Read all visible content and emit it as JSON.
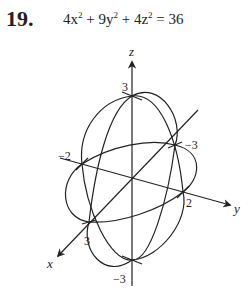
{
  "problem": {
    "number": "19.",
    "equation_parts": [
      "4x",
      "2",
      " + 9y",
      "2",
      " + 4z",
      "2",
      " = 36"
    ]
  },
  "diagram": {
    "axes": {
      "x_label": "x",
      "y_label": "y",
      "z_label": "z"
    },
    "intercepts": {
      "z_pos": "3",
      "z_neg": "−3",
      "x_pos": "3",
      "x_neg": "−3",
      "y_pos": "2",
      "y_neg": "−2"
    }
  }
}
